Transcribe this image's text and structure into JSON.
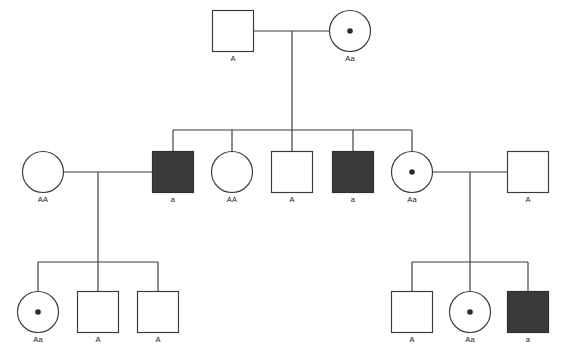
{
  "figure": {
    "type": "pedigree",
    "background_color": "#ffffff",
    "line_color": "#3a3a3a",
    "affected_fill_color": "#3b3b3b",
    "unaffected_fill_color": "#ffffff",
    "carrier_dot_color": "#2b2b2b"
  },
  "legend_semantics": {
    "square": "male",
    "circle": "female",
    "filled": "affected",
    "open": "unaffected",
    "dot_in_shape": "carrier"
  },
  "generations": [
    {
      "id": "I",
      "individuals": [
        {
          "id": "I-1",
          "sex": "male",
          "shape": "square",
          "status": "unaffected",
          "carrier": false,
          "genotype_label": "A",
          "cx": 233,
          "cy": 31
        },
        {
          "id": "I-2",
          "sex": "female",
          "shape": "circle",
          "status": "unaffected",
          "carrier": true,
          "genotype_label": "Aa",
          "cx": 350,
          "cy": 31
        }
      ]
    },
    {
      "id": "II",
      "individuals": [
        {
          "id": "II-1",
          "sex": "female",
          "shape": "circle",
          "status": "unaffected",
          "carrier": false,
          "genotype_label": "AA",
          "cx": 43,
          "cy": 172
        },
        {
          "id": "II-2",
          "sex": "male",
          "shape": "square",
          "status": "affected",
          "carrier": false,
          "genotype_label": "a",
          "cx": 173,
          "cy": 172
        },
        {
          "id": "II-3",
          "sex": "female",
          "shape": "circle",
          "status": "unaffected",
          "carrier": false,
          "genotype_label": "AA",
          "cx": 232,
          "cy": 172
        },
        {
          "id": "II-4",
          "sex": "male",
          "shape": "square",
          "status": "unaffected",
          "carrier": false,
          "genotype_label": "A",
          "cx": 292,
          "cy": 172
        },
        {
          "id": "II-5",
          "sex": "male",
          "shape": "square",
          "status": "affected",
          "carrier": false,
          "genotype_label": "a",
          "cx": 353,
          "cy": 172
        },
        {
          "id": "II-6",
          "sex": "female",
          "shape": "circle",
          "status": "unaffected",
          "carrier": true,
          "genotype_label": "Aa",
          "cx": 412,
          "cy": 172
        },
        {
          "id": "II-7",
          "sex": "male",
          "shape": "square",
          "status": "unaffected",
          "carrier": false,
          "genotype_label": "A",
          "cx": 528,
          "cy": 172
        }
      ]
    },
    {
      "id": "III",
      "individuals": [
        {
          "id": "III-1",
          "sex": "female",
          "shape": "circle",
          "status": "unaffected",
          "carrier": true,
          "genotype_label": "Aa",
          "cx": 38,
          "cy": 312
        },
        {
          "id": "III-2",
          "sex": "male",
          "shape": "square",
          "status": "unaffected",
          "carrier": false,
          "genotype_label": "A",
          "cx": 98,
          "cy": 312
        },
        {
          "id": "III-3",
          "sex": "male",
          "shape": "square",
          "status": "unaffected",
          "carrier": false,
          "genotype_label": "A",
          "cx": 158,
          "cy": 312
        },
        {
          "id": "III-4",
          "sex": "male",
          "shape": "square",
          "status": "unaffected",
          "carrier": false,
          "genotype_label": "A",
          "cx": 412,
          "cy": 312
        },
        {
          "id": "III-5",
          "sex": "female",
          "shape": "circle",
          "status": "unaffected",
          "carrier": true,
          "genotype_label": "Aa",
          "cx": 470,
          "cy": 312
        },
        {
          "id": "III-6",
          "sex": "male",
          "shape": "square",
          "status": "affected",
          "carrier": false,
          "genotype_label": "a",
          "cx": 528,
          "cy": 312
        }
      ]
    }
  ],
  "matings": [
    {
      "id": "mating-1",
      "partners": [
        "I-1",
        "I-2"
      ],
      "children": [
        "II-2",
        "II-3",
        "II-4",
        "II-5",
        "II-6"
      ]
    },
    {
      "id": "mating-2",
      "partners": [
        "II-1",
        "II-2"
      ],
      "children": [
        "III-1",
        "III-2",
        "III-3"
      ]
    },
    {
      "id": "mating-3",
      "partners": [
        "II-6",
        "II-7"
      ],
      "children": [
        "III-4",
        "III-5",
        "III-6"
      ]
    }
  ],
  "geometry": {
    "square_size": 41,
    "circle_radius": 20.5,
    "carrier_dot_radius": 2.8,
    "mating_line_y_gen1": 31,
    "mating_line_y_gen2": 172,
    "sibship_bar_y_gen2": 130,
    "sibship_bar_y_gen3": 262,
    "gen1_drop_x": 292,
    "gen2_left_drop_x": 98,
    "gen2_right_drop_x": 470,
    "label_offset_y": 30
  }
}
